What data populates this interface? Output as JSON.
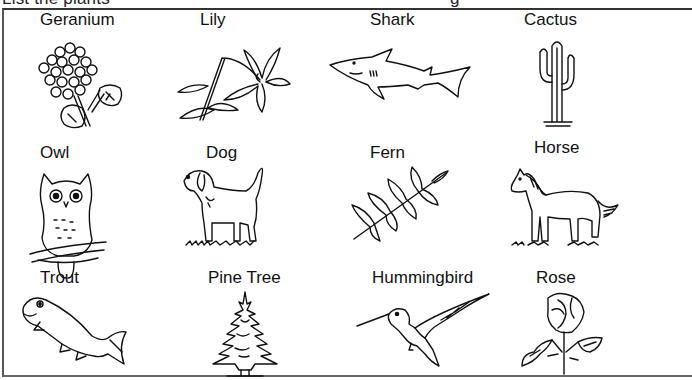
{
  "page": {
    "heading_partial": "List the plants",
    "heading_partial_right": "g"
  },
  "items": [
    {
      "label": "Geranium",
      "kind": "plant",
      "icon": "geranium-icon"
    },
    {
      "label": "Lily",
      "kind": "plant",
      "icon": "lily-icon"
    },
    {
      "label": "Shark",
      "kind": "animal",
      "icon": "shark-icon"
    },
    {
      "label": "Cactus",
      "kind": "plant",
      "icon": "cactus-icon"
    },
    {
      "label": "Owl",
      "kind": "animal",
      "icon": "owl-icon"
    },
    {
      "label": "Dog",
      "kind": "animal",
      "icon": "dog-icon"
    },
    {
      "label": "Fern",
      "kind": "plant",
      "icon": "fern-icon"
    },
    {
      "label": "Horse",
      "kind": "animal",
      "icon": "horse-icon"
    },
    {
      "label": "Trout",
      "kind": "animal",
      "icon": "trout-icon"
    },
    {
      "label": "Pine Tree",
      "kind": "plant",
      "icon": "pine-tree-icon"
    },
    {
      "label": "Hummingbird",
      "kind": "animal",
      "icon": "hummingbird-icon"
    },
    {
      "label": "Rose",
      "kind": "plant",
      "icon": "rose-icon"
    }
  ]
}
